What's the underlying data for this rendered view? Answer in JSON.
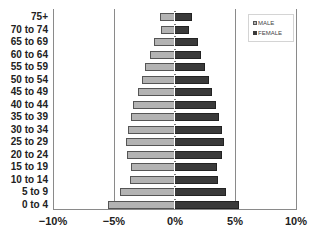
{
  "chart_data": {
    "type": "bar",
    "orientation": "horizontal",
    "subtype": "population-pyramid",
    "title": "",
    "xlabel": "",
    "ylabel": "",
    "categories": [
      "75+",
      "70 to 74",
      "65 to 69",
      "60 to 64",
      "55 to 59",
      "50 to 54",
      "45 to 49",
      "40 to 44",
      "35 to 39",
      "30 to 34",
      "25 to 29",
      "20 to 24",
      "15 to 19",
      "10 to 14",
      "5 to 9",
      "0 to 4"
    ],
    "series": [
      {
        "name": "MALE",
        "color": "#b3b3b3",
        "values": [
          -1.2,
          -1.1,
          -1.7,
          -2.0,
          -2.4,
          -2.7,
          -3.0,
          -3.4,
          -3.6,
          -3.8,
          -4.0,
          -3.9,
          -3.6,
          -3.7,
          -4.5,
          -5.5
        ]
      },
      {
        "name": "FEMALE",
        "color": "#3a3a3a",
        "values": [
          1.4,
          1.2,
          1.9,
          2.2,
          2.5,
          2.8,
          3.1,
          3.4,
          3.7,
          3.9,
          4.1,
          3.9,
          3.5,
          3.6,
          4.2,
          5.3
        ]
      }
    ],
    "xlim": [
      -10,
      10
    ],
    "xticks": [
      -10,
      -5,
      0,
      5,
      10
    ],
    "xtick_labels": [
      "−10%",
      "−5%",
      "0%",
      "5%",
      "10%"
    ],
    "grid": {
      "vertical": true,
      "horizontal": false
    },
    "legend": {
      "position": "top-right",
      "entries": [
        "MALE",
        "FEMALE"
      ]
    }
  },
  "legend": {
    "male": "MALE",
    "female": "FEMALE"
  },
  "axis": {
    "x_ticks": [
      "−10%",
      "−5%",
      "0%",
      "5%",
      "10%"
    ]
  }
}
